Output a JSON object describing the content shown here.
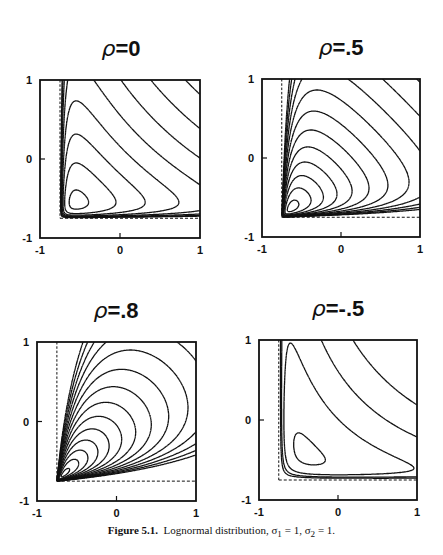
{
  "chart_data": {
    "type": "contour",
    "caption": {
      "label": "Figure 5.1.",
      "text": "Lognormal distribution, σ",
      "sigma1_sub": "1",
      "mid": " = 1, σ",
      "sigma2_sub": "2",
      "tail": " = 1."
    },
    "sigma1": 1,
    "sigma2": 1,
    "xlim": [
      -1,
      1
    ],
    "ylim": [
      -1,
      1
    ],
    "xticks": [
      "-1",
      "0",
      "1"
    ],
    "yticks": [
      "-1",
      "0",
      "1"
    ],
    "dashed_lines": {
      "x": -0.75,
      "y": -0.75
    },
    "panels": [
      {
        "id": "rho-0",
        "rho_label": "ρ",
        "value_label": "=0",
        "rho": 0,
        "box": {
          "x": 40,
          "y": 80,
          "w": 160,
          "h": 158
        },
        "title_pos": {
          "x": 121,
          "y": 56
        },
        "num_contours": 8
      },
      {
        "id": "rho-0.5",
        "rho_label": "ρ",
        "value_label": "=.5",
        "rho": 0.5,
        "box": {
          "x": 262,
          "y": 79,
          "w": 158,
          "h": 158
        },
        "title_pos": {
          "x": 341,
          "y": 55
        },
        "num_contours": 12
      },
      {
        "id": "rho-0.8",
        "rho_label": "ρ",
        "value_label": "=.8",
        "rho": 0.8,
        "box": {
          "x": 37,
          "y": 342,
          "w": 159,
          "h": 159
        },
        "title_pos": {
          "x": 116,
          "y": 318
        },
        "num_contours": 14
      },
      {
        "id": "rho-neg0.5",
        "rho_label": "ρ",
        "value_label": "=-.5",
        "rho": -0.5,
        "box": {
          "x": 259,
          "y": 340,
          "w": 158,
          "h": 160
        },
        "title_pos": {
          "x": 338,
          "y": 316
        },
        "num_contours": 4
      }
    ]
  }
}
